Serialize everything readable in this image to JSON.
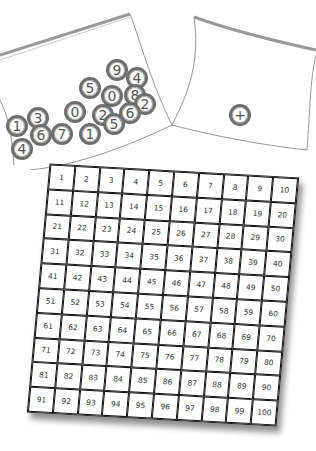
{
  "scene": {
    "description": "Two zip-lock bags of number counters above a hundred chart",
    "colors": {
      "coin_border": "#6e6e6e",
      "grid_line": "#111111",
      "bag_outline": "#999999"
    }
  },
  "left_bag": {
    "coins": [
      {
        "label": "9",
        "x": 117,
        "y": 70
      },
      {
        "label": "4",
        "x": 137,
        "y": 78
      },
      {
        "label": "5",
        "x": 90,
        "y": 88
      },
      {
        "label": "0",
        "x": 112,
        "y": 96
      },
      {
        "label": "8",
        "x": 135,
        "y": 95
      },
      {
        "label": "2",
        "x": 145,
        "y": 104
      },
      {
        "label": "0",
        "x": 75,
        "y": 112
      },
      {
        "label": "2",
        "x": 103,
        "y": 115
      },
      {
        "label": "6",
        "x": 130,
        "y": 113
      },
      {
        "label": "5",
        "x": 114,
        "y": 124
      },
      {
        "label": "1",
        "x": 17,
        "y": 126
      },
      {
        "label": "3",
        "x": 38,
        "y": 118
      },
      {
        "label": "6",
        "x": 41,
        "y": 135
      },
      {
        "label": "7",
        "x": 62,
        "y": 134
      },
      {
        "label": "1",
        "x": 90,
        "y": 134
      },
      {
        "label": "4",
        "x": 22,
        "y": 149
      }
    ]
  },
  "right_bag": {
    "coins": [
      {
        "label": "+",
        "x": 240,
        "y": 115
      }
    ]
  },
  "hundred_chart": {
    "rows": 10,
    "cols": 10,
    "cells": [
      "1",
      "2",
      "3",
      "4",
      "5",
      "6",
      "7",
      "8",
      "9",
      "10",
      "11",
      "12",
      "13",
      "14",
      "15",
      "16",
      "17",
      "18",
      "19",
      "20",
      "21",
      "22",
      "23",
      "24",
      "25",
      "26",
      "27",
      "28",
      "29",
      "30",
      "31",
      "32",
      "33",
      "34",
      "35",
      "36",
      "37",
      "38",
      "39",
      "40",
      "41",
      "42",
      "43",
      "44",
      "45",
      "46",
      "47",
      "48",
      "49",
      "50",
      "51",
      "52",
      "53",
      "54",
      "55",
      "56",
      "57",
      "58",
      "59",
      "60",
      "61",
      "62",
      "63",
      "64",
      "65",
      "66",
      "67",
      "68",
      "69",
      "70",
      "71",
      "72",
      "73",
      "74",
      "75",
      "76",
      "77",
      "78",
      "79",
      "80",
      "81",
      "82",
      "83",
      "84",
      "85",
      "86",
      "87",
      "88",
      "89",
      "90",
      "91",
      "92",
      "93",
      "94",
      "95",
      "96",
      "97",
      "98",
      "99",
      "100"
    ]
  }
}
